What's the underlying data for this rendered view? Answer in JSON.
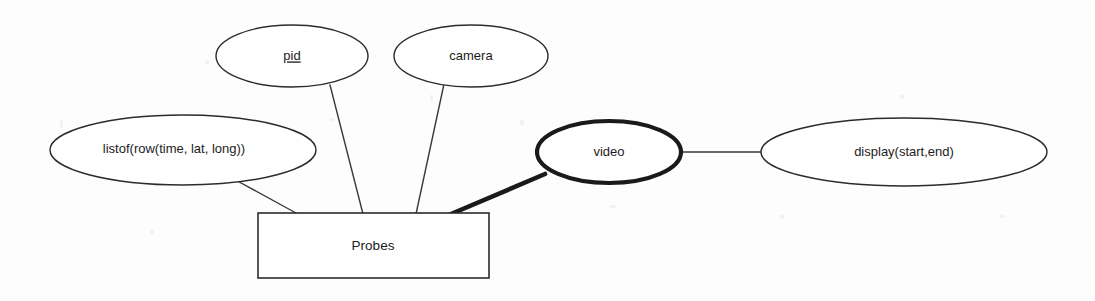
{
  "diagram": {
    "type": "entity-relationship",
    "background_color": "#fdfdfd",
    "line_color": "#2b2b2b",
    "entities": [
      {
        "id": "probes",
        "label": "Probes",
        "shape": "rectangle"
      }
    ],
    "attributes": [
      {
        "id": "pid",
        "label": "pid",
        "shape": "ellipse",
        "key": true,
        "underlined": true,
        "border": "thin"
      },
      {
        "id": "camera",
        "label": "camera",
        "shape": "ellipse",
        "key": false,
        "underlined": false,
        "border": "thin"
      },
      {
        "id": "listof",
        "label": "listof(row(time, lat, long))",
        "shape": "ellipse",
        "key": false,
        "underlined": false,
        "border": "thin"
      },
      {
        "id": "video",
        "label": "video",
        "shape": "ellipse",
        "key": false,
        "underlined": false,
        "border": "thick"
      },
      {
        "id": "display",
        "label": "display(start,end)",
        "shape": "ellipse",
        "key": false,
        "underlined": false,
        "border": "thin"
      }
    ],
    "edges": [
      {
        "id": "listof-probes",
        "from": "listof",
        "to": "probes",
        "style": "thin"
      },
      {
        "id": "pid-probes",
        "from": "pid",
        "to": "probes",
        "style": "thin"
      },
      {
        "id": "camera-probes",
        "from": "camera",
        "to": "probes",
        "style": "thin"
      },
      {
        "id": "video-probes",
        "from": "video",
        "to": "probes",
        "style": "thick"
      },
      {
        "id": "video-display",
        "from": "video",
        "to": "display",
        "style": "thin"
      }
    ]
  }
}
